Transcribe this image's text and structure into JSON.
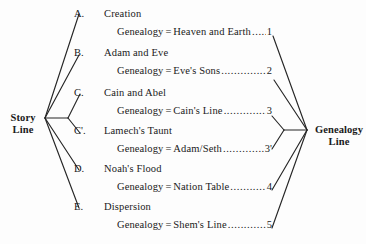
{
  "diagram": {
    "type": "tree-fan",
    "left_node": {
      "line1": "Story",
      "line2": "Line"
    },
    "right_node": {
      "line1": "Genealogy",
      "line2": "Line"
    },
    "leader_dots": "............................................................",
    "rows": [
      {
        "letter": "A.",
        "title": "Creation",
        "genealogy_label": "Genealogy",
        "equals": "=",
        "genealogy_value": "Heaven and Earth",
        "number": "1"
      },
      {
        "letter": "B.",
        "title": "Adam and Eve",
        "genealogy_label": "Genealogy",
        "equals": "=",
        "genealogy_value": "Eve's Sons",
        "number": "2"
      },
      {
        "letter": "C.",
        "title": "Cain and Abel",
        "genealogy_label": "Genealogy",
        "equals": "=",
        "genealogy_value": "Cain's Line",
        "number": "3"
      },
      {
        "letter": "C'.",
        "title": "Lamech's Taunt",
        "genealogy_label": "Genealogy",
        "equals": "=",
        "genealogy_value": "Adam/Seth",
        "number": "3'"
      },
      {
        "letter": "D.",
        "title": "Noah's Flood",
        "genealogy_label": "Genealogy",
        "equals": "=",
        "genealogy_value": "Nation Table",
        "number": "4"
      },
      {
        "letter": "E.",
        "title": "Dispersion",
        "genealogy_label": "Genealogy",
        "equals": "=",
        "genealogy_value": "Shem's Line",
        "number": "5"
      }
    ],
    "colors": {
      "background": "#fdfdfd",
      "ink": "#1a1a1a",
      "line": "#262626"
    }
  }
}
